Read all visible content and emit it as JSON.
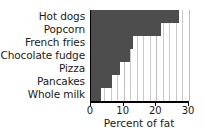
{
  "chart_data": {
    "type": "bar",
    "orientation": "horizontal",
    "title": "",
    "xlabel": "Percent of fat",
    "ylabel": "",
    "categories": [
      "Hot dogs",
      "Popcorn",
      "French fries",
      "Chocolate fudge",
      "Pizza",
      "Pancakes",
      "Whole milk"
    ],
    "values": [
      27,
      21.5,
      13,
      12,
      9,
      6.5,
      3
    ],
    "xlim": [
      0,
      30
    ],
    "xticks": [
      0,
      10,
      20,
      30
    ],
    "xtick_labels": [
      "0",
      "10",
      "20",
      "30"
    ],
    "minor_gridline_step": 2,
    "grid": true,
    "grid_axis": "x",
    "legend": false,
    "bar_color": "#4d4d4d",
    "gridline_color": "#c9c9c9",
    "axis_color": "#000000",
    "background": "#ffffff"
  }
}
